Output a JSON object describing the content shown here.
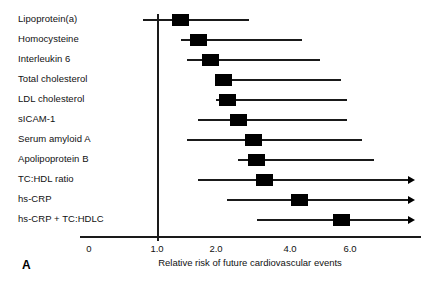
{
  "panel": {
    "letter": "A"
  },
  "chart_data": {
    "type": "bar",
    "subtype": "forest-plot",
    "title": "",
    "xlabel": "Relative risk of future cardiovascular events",
    "ylabel": "",
    "reference_line": 1.0,
    "grid": false,
    "legend": null,
    "xlim": [
      0,
      7.0
    ],
    "xticks": [
      0,
      1.0,
      2.0,
      4.0,
      6.0
    ],
    "xtick_labels": [
      "0",
      "1.0",
      "2.0",
      "4.0",
      "6.0"
    ],
    "categories": [
      "Lipoprotein(a)",
      "Homocysteine",
      "Interleukin 6",
      "Total cholesterol",
      "LDL cholesterol",
      "sICAM-1",
      "Serum amyloid A",
      "Apolipoprotein B",
      "TC:HDL ratio",
      "hs-CRP",
      "hs-CRP + TC:HDLC"
    ],
    "points": [
      {
        "label": "Lipoprotein(a)",
        "value": 1.4,
        "ci_low": 0.8,
        "ci_high": 2.9,
        "right_open": false
      },
      {
        "label": "Homocysteine",
        "value": 1.7,
        "ci_low": 1.4,
        "ci_high": 4.4,
        "right_open": false
      },
      {
        "label": "Interleukin 6",
        "value": 1.9,
        "ci_low": 1.5,
        "ci_high": 5.0,
        "right_open": false
      },
      {
        "label": "Total cholesterol",
        "value": 2.2,
        "ci_low": 2.0,
        "ci_high": 5.7,
        "right_open": false
      },
      {
        "label": "LDL cholesterol",
        "value": 2.3,
        "ci_low": 2.0,
        "ci_high": 5.9,
        "right_open": false
      },
      {
        "label": "sICAM-1",
        "value": 2.6,
        "ci_low": 1.7,
        "ci_high": 5.9,
        "right_open": false
      },
      {
        "label": "Serum amyloid A",
        "value": 3.0,
        "ci_low": 1.5,
        "ci_high": 6.4,
        "right_open": false
      },
      {
        "label": "Apolipoprotein B",
        "value": 3.1,
        "ci_low": 2.6,
        "ci_high": 6.8,
        "right_open": false
      },
      {
        "label": "TC:HDL ratio",
        "value": 3.3,
        "ci_low": 1.7,
        "ci_high": 7.0,
        "right_open": true
      },
      {
        "label": "hs-CRP",
        "value": 4.3,
        "ci_low": 2.3,
        "ci_high": 7.0,
        "right_open": true
      },
      {
        "label": "hs-CRP + TC:HDLC",
        "value": 5.7,
        "ci_low": 3.1,
        "ci_high": 7.0,
        "right_open": true
      }
    ]
  }
}
